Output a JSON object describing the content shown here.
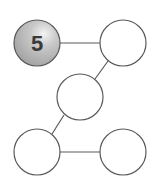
{
  "diagram": {
    "nodes": [
      {
        "id": "n1",
        "label": "5",
        "cx": 37,
        "cy": 43,
        "r": 23,
        "filled": true
      },
      {
        "id": "n2",
        "label": "",
        "cx": 123,
        "cy": 43,
        "r": 23,
        "filled": false
      },
      {
        "id": "n3",
        "label": "",
        "cx": 80,
        "cy": 97,
        "r": 23,
        "filled": false
      },
      {
        "id": "n4",
        "label": "",
        "cx": 37,
        "cy": 152,
        "r": 23,
        "filled": false
      },
      {
        "id": "n5",
        "label": "",
        "cx": 123,
        "cy": 152,
        "r": 23,
        "filled": false
      }
    ],
    "edges": [
      [
        "n1",
        "n2"
      ],
      [
        "n2",
        "n3"
      ],
      [
        "n3",
        "n4"
      ],
      [
        "n4",
        "n5"
      ]
    ],
    "colors": {
      "stroke": "#5a5a5a",
      "filled_node": "#bdbdbd",
      "label": "#3a3a3a"
    }
  }
}
